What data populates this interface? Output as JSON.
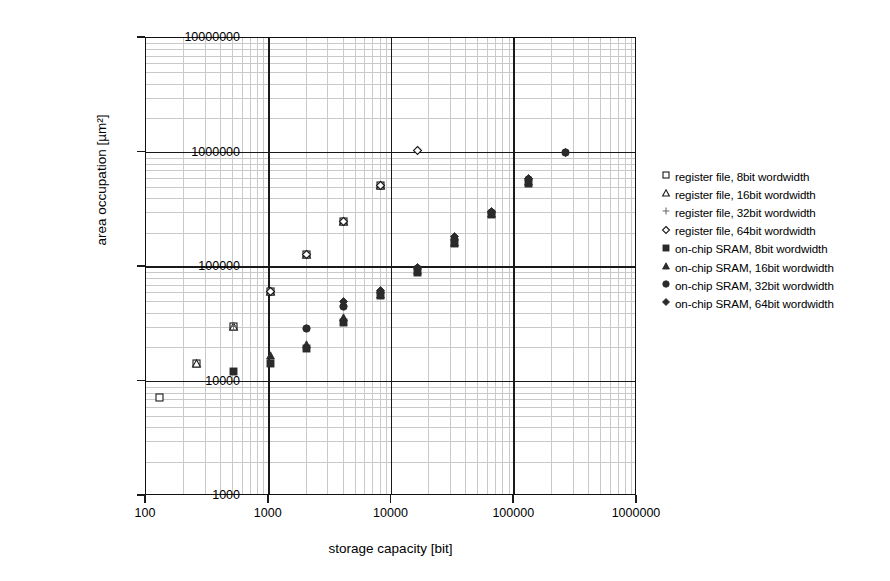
{
  "chart_data": {
    "type": "scatter",
    "title": "",
    "xlabel": "storage capacity [bit]",
    "ylabel": "area occupation [µm²]",
    "xscale": "log",
    "yscale": "log",
    "xlim": [
      100,
      1000000
    ],
    "ylim": [
      1000,
      10000000
    ],
    "xticks": [
      "100",
      "1000",
      "10000",
      "100000",
      "1000000"
    ],
    "yticks": [
      "1000",
      "10000",
      "100000",
      "1000000",
      "10000000"
    ],
    "grid": "major and minor log grid",
    "legend_position": "right outside",
    "series": [
      {
        "name": "register file, 8bit wordwidth",
        "marker": "open-square",
        "points": [
          {
            "x": 128,
            "y": 7300
          },
          {
            "x": 256,
            "y": 14500
          },
          {
            "x": 512,
            "y": 30000
          },
          {
            "x": 1024,
            "y": 61000
          },
          {
            "x": 2048,
            "y": 128000
          },
          {
            "x": 4096,
            "y": 250000
          },
          {
            "x": 8192,
            "y": 520000
          }
        ]
      },
      {
        "name": "register file, 16bit wordwidth",
        "marker": "open-triangle",
        "points": [
          {
            "x": 256,
            "y": 14500
          },
          {
            "x": 512,
            "y": 30000
          },
          {
            "x": 1024,
            "y": 61000
          },
          {
            "x": 2048,
            "y": 128000
          },
          {
            "x": 4096,
            "y": 250000
          },
          {
            "x": 8192,
            "y": 520000
          }
        ]
      },
      {
        "name": "register file, 32bit wordwidth",
        "marker": "plus",
        "points": [
          {
            "x": 512,
            "y": 30000
          },
          {
            "x": 1024,
            "y": 61000
          },
          {
            "x": 2048,
            "y": 128000
          },
          {
            "x": 4096,
            "y": 250000
          },
          {
            "x": 8192,
            "y": 520000
          }
        ]
      },
      {
        "name": "register file, 64bit wordwidth",
        "marker": "open-diamond",
        "points": [
          {
            "x": 1024,
            "y": 61000
          },
          {
            "x": 2048,
            "y": 128000
          },
          {
            "x": 4096,
            "y": 250000
          },
          {
            "x": 8192,
            "y": 520000
          },
          {
            "x": 16384,
            "y": 1050000
          }
        ]
      },
      {
        "name": "on-chip SRAM, 8bit wordwidth",
        "marker": "filled-square",
        "points": [
          {
            "x": 512,
            "y": 12300
          },
          {
            "x": 1024,
            "y": 14300
          },
          {
            "x": 2048,
            "y": 19500
          },
          {
            "x": 4096,
            "y": 33000
          },
          {
            "x": 8192,
            "y": 56000
          },
          {
            "x": 16384,
            "y": 90000
          },
          {
            "x": 32768,
            "y": 160000
          },
          {
            "x": 65536,
            "y": 290000
          },
          {
            "x": 131072,
            "y": 540000
          }
        ]
      },
      {
        "name": "on-chip SRAM, 16bit wordwidth",
        "marker": "filled-triangle",
        "points": [
          {
            "x": 1024,
            "y": 17000
          },
          {
            "x": 2048,
            "y": 21000
          },
          {
            "x": 4096,
            "y": 36000
          },
          {
            "x": 8192,
            "y": 58000
          },
          {
            "x": 16384,
            "y": 93000
          },
          {
            "x": 32768,
            "y": 165000
          },
          {
            "x": 65536,
            "y": 295000
          },
          {
            "x": 131072,
            "y": 555000
          }
        ]
      },
      {
        "name": "on-chip SRAM, 32bit wordwidth",
        "marker": "filled-circle",
        "points": [
          {
            "x": 2048,
            "y": 29000
          },
          {
            "x": 4096,
            "y": 45000
          },
          {
            "x": 8192,
            "y": 60000
          },
          {
            "x": 16384,
            "y": 97000
          },
          {
            "x": 32768,
            "y": 175000
          },
          {
            "x": 65536,
            "y": 300000
          },
          {
            "x": 131072,
            "y": 580000
          },
          {
            "x": 262144,
            "y": 1000000
          }
        ]
      },
      {
        "name": "on-chip SRAM, 64bit wordwidth",
        "marker": "filled-diamond",
        "points": [
          {
            "x": 4096,
            "y": 50000
          },
          {
            "x": 8192,
            "y": 62000
          },
          {
            "x": 16384,
            "y": 100000
          },
          {
            "x": 32768,
            "y": 185000
          },
          {
            "x": 65536,
            "y": 305000
          },
          {
            "x": 131072,
            "y": 590000
          },
          {
            "x": 262144,
            "y": 1000000
          }
        ]
      }
    ]
  },
  "legend": {
    "items": [
      {
        "label": "register file, 8bit wordwidth",
        "marker": "open-square"
      },
      {
        "label": "register file, 16bit wordwidth",
        "marker": "open-triangle"
      },
      {
        "label": "register file, 32bit wordwidth",
        "marker": "plus"
      },
      {
        "label": "register file, 64bit wordwidth",
        "marker": "open-diamond"
      },
      {
        "label": "on-chip SRAM, 8bit wordwidth",
        "marker": "filled-square"
      },
      {
        "label": "on-chip SRAM, 16bit wordwidth",
        "marker": "filled-triangle"
      },
      {
        "label": "on-chip SRAM, 32bit wordwidth",
        "marker": "filled-circle"
      },
      {
        "label": "on-chip SRAM, 64bit wordwidth",
        "marker": "filled-diamond"
      }
    ]
  },
  "colors": {
    "axis": "#1a1a1a",
    "minor_grid": "#c9c9c9",
    "marker_fill": "#2b2b2b",
    "marker_stroke": "#1a1a1a",
    "background": "#ffffff"
  }
}
